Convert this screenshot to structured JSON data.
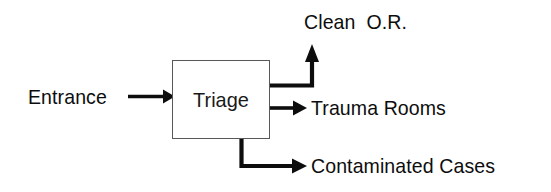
{
  "diagram": {
    "background_color": "#ffffff",
    "stroke_color": "#0d0d0d",
    "box_border_color": "#58585a",
    "nodes": {
      "process": {
        "label": "Triage",
        "shape": "rectangle"
      },
      "input": {
        "label": "Entrance"
      },
      "outputs": [
        {
          "label": "Clean  O.R.",
          "direction": "up-right"
        },
        {
          "label": "Trauma Rooms",
          "direction": "right"
        },
        {
          "label": "Contaminated Cases",
          "direction": "down-right"
        }
      ]
    },
    "edges": [
      {
        "name": "entrance-to-triage",
        "from": "Entrance",
        "to": "Triage",
        "style": "straight-arrow"
      },
      {
        "name": "triage-to-clean-or",
        "from": "Triage",
        "to": "Clean  O.R.",
        "style": "elbow-arrow-up"
      },
      {
        "name": "triage-to-trauma-rooms",
        "from": "Triage",
        "to": "Trauma Rooms",
        "style": "straight-arrow"
      },
      {
        "name": "triage-to-contaminated-cases",
        "from": "Triage",
        "to": "Contaminated Cases",
        "style": "elbow-arrow-down"
      }
    ]
  }
}
